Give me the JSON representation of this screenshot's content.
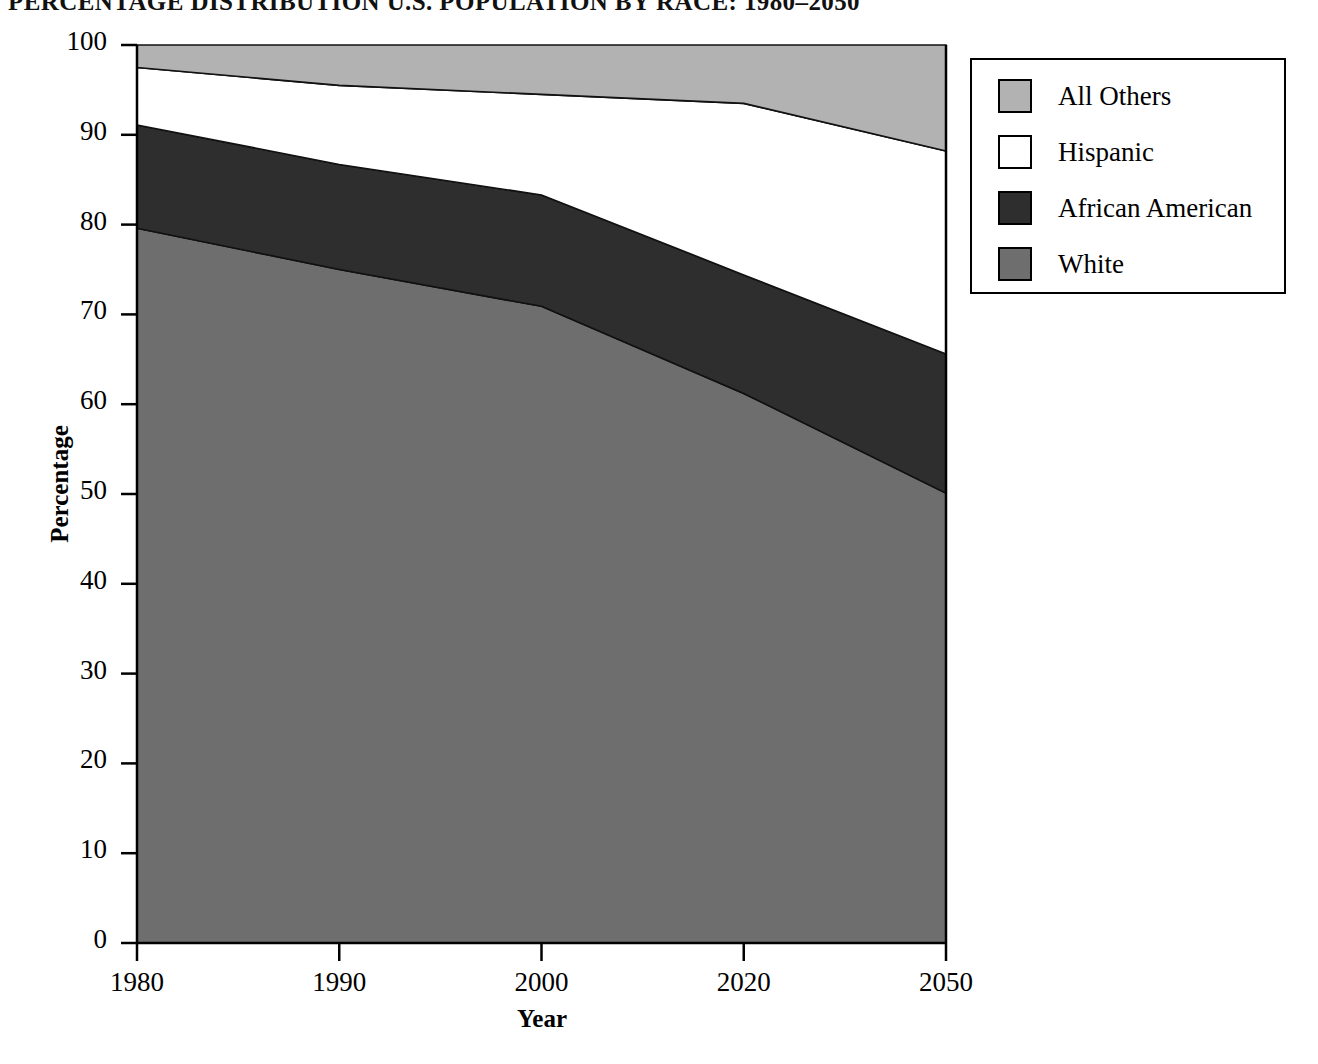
{
  "title": "PERCENTAGE DISTRIBUTION U.S. POPULATION BY RACE: 1980–2050",
  "axes": {
    "x_title": "Year",
    "y_title": "Percentage",
    "x_ticks": [
      "1980",
      "1990",
      "2000",
      "2020",
      "2050"
    ],
    "y_ticks": [
      "100",
      "90",
      "80",
      "70",
      "60",
      "50",
      "40",
      "30",
      "20",
      "10",
      "0"
    ]
  },
  "legend": {
    "items": [
      {
        "label": "All Others",
        "color": "#b2b2b2"
      },
      {
        "label": "Hispanic",
        "color": "#ffffff"
      },
      {
        "label": "African American",
        "color": "#2e2e2e"
      },
      {
        "label": "White",
        "color": "#6e6e6e"
      }
    ]
  },
  "chart_data": {
    "type": "area",
    "title": "PERCENTAGE DISTRIBUTION U.S. POPULATION BY RACE: 1980–2050",
    "xlabel": "Year",
    "ylabel": "Percentage",
    "ylim": [
      0,
      100
    ],
    "grid": false,
    "stacked": true,
    "legend_position": "top-right",
    "categories": [
      "1980",
      "1990",
      "2000",
      "2020",
      "2050"
    ],
    "x": [
      1980,
      1990,
      2000,
      2020,
      2050
    ],
    "series": [
      {
        "name": "White",
        "color": "#6e6e6e",
        "values": [
          79.6,
          75.0,
          70.9,
          61.2,
          50.1
        ]
      },
      {
        "name": "African American",
        "color": "#2e2e2e",
        "values": [
          11.5,
          11.7,
          12.4,
          13.2,
          15.5
        ]
      },
      {
        "name": "Hispanic",
        "color": "#ffffff",
        "values": [
          6.4,
          8.8,
          11.2,
          19.1,
          22.6
        ]
      },
      {
        "name": "All Others",
        "color": "#b2b2b2",
        "values": [
          2.5,
          4.5,
          5.5,
          6.5,
          11.8
        ]
      }
    ],
    "cumulative_tops": {
      "White": [
        79.6,
        75.0,
        70.9,
        61.2,
        50.1
      ],
      "African American": [
        91.1,
        86.7,
        83.3,
        74.4,
        65.6
      ],
      "Hispanic": [
        97.5,
        95.5,
        94.5,
        93.5,
        88.2
      ],
      "All Others": [
        100,
        100,
        100,
        100,
        100
      ]
    }
  }
}
